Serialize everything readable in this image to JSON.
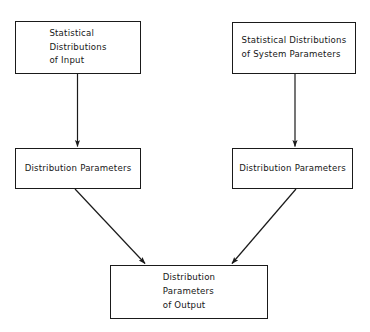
{
  "diagram": {
    "background_color": "#ffffff",
    "line_color": "#1a1a1a",
    "text_color": "#161616",
    "nodes": {
      "input": {
        "label": "Statistical\nDistributions\nof Input"
      },
      "system": {
        "label": "Statistical Distributions\nof System Parameters"
      },
      "dp_left": {
        "label": "Distribution Parameters"
      },
      "dp_right": {
        "label": "Distribution Parameters"
      },
      "output": {
        "label": "Distribution\nParameters\nof Output"
      }
    },
    "edges": [
      {
        "name": "input-to-dp-left",
        "from": "input",
        "to": "dp_left",
        "style": "vertical-arrow"
      },
      {
        "name": "system-to-dp-right",
        "from": "system",
        "to": "dp_right",
        "style": "vertical-arrow"
      },
      {
        "name": "dp-left-to-output",
        "from": "dp_left",
        "to": "output",
        "style": "diagonal-arrow"
      },
      {
        "name": "dp-right-to-output",
        "from": "dp_right",
        "to": "output",
        "style": "diagonal-arrow"
      }
    ]
  }
}
